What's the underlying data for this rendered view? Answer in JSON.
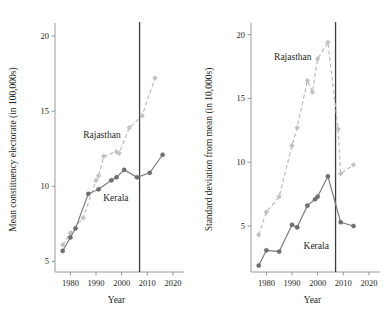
{
  "figure": {
    "background": "#ffffff",
    "width": 392,
    "height": 322,
    "panel_count": 2
  },
  "colors": {
    "kerala_line": "#7a7a7a",
    "kerala_marker": "#6e6e6e",
    "rajasthan_line": "#b9b9b9",
    "rajasthan_marker": "#c2c2c2",
    "axis": "#808080",
    "event_line": "#3d3d3d",
    "text": "#231f20"
  },
  "chart_data": [
    {
      "panel": "left",
      "type": "line",
      "title": "",
      "xlabel": "Year",
      "ylabel": "Mean constituency electorate (in 100,000s)",
      "xlim": [
        1974,
        2022
      ],
      "ylim": [
        4.3,
        20.6
      ],
      "xticks": [
        1980,
        1990,
        2000,
        2010,
        2020
      ],
      "xticklabels": [
        "1980",
        "1990",
        "2000",
        "2010",
        "2020"
      ],
      "yticks": [
        5,
        10,
        15,
        20
      ],
      "yticklabels": [
        "5",
        "10",
        "15",
        "20"
      ],
      "grid": false,
      "legend_position": "inline-annotation",
      "annotations": [
        {
          "text": "Rajasthan",
          "x": 1985.0,
          "y": 13.2
        },
        {
          "text": "Kerala",
          "x": 1992.8,
          "y": 9.0
        }
      ],
      "vertical_reference_line": {
        "x": 2007,
        "label": ""
      },
      "series": [
        {
          "name": "Rajasthan",
          "style": "dashed",
          "marker": "diamond",
          "x": [
            1977,
            1980,
            1985,
            1990,
            1991,
            1993,
            1998,
            1999,
            2003,
            2008,
            2013
          ],
          "values": [
            6.1,
            6.9,
            7.9,
            10.4,
            10.7,
            12.0,
            12.3,
            12.2,
            13.9,
            14.7,
            17.2
          ]
        },
        {
          "name": "Kerala",
          "style": "solid",
          "marker": "circle",
          "x": [
            1977,
            1980,
            1982,
            1987,
            1991,
            1996,
            1998,
            2001,
            2006,
            2011,
            2016
          ],
          "values": [
            5.7,
            6.6,
            7.2,
            9.5,
            9.8,
            10.4,
            10.6,
            11.1,
            10.6,
            10.9,
            12.1
          ]
        }
      ]
    },
    {
      "panel": "right",
      "type": "line",
      "title": "",
      "xlabel": "Year",
      "ylabel": "Standard deviation from mean (in 10,000s)",
      "xlim": [
        1974,
        2022
      ],
      "ylim": [
        1.4,
        20.6
      ],
      "xticks": [
        1980,
        1990,
        2000,
        2010,
        2020
      ],
      "xticklabels": [
        "1980",
        "1990",
        "2000",
        "2010",
        "2020"
      ],
      "yticks": [
        5,
        10,
        15,
        20
      ],
      "yticklabels": [
        "5",
        "10",
        "15",
        "20"
      ],
      "grid": false,
      "legend_position": "inline-annotation",
      "annotations": [
        {
          "text": "Rajasthan",
          "x": 1983.0,
          "y": 18.0
        },
        {
          "text": "Kerala",
          "x": 1994.5,
          "y": 3.2
        }
      ],
      "vertical_reference_line": {
        "x": 2007,
        "label": ""
      },
      "series": [
        {
          "name": "Rajasthan",
          "style": "dashed",
          "marker": "diamond",
          "x": [
            1977,
            1980,
            1985,
            1990,
            1992,
            1996,
            1998,
            2000,
            2004,
            2008,
            2009,
            2014
          ],
          "values": [
            4.3,
            6.1,
            7.3,
            11.3,
            12.7,
            16.4,
            15.5,
            18.1,
            19.4,
            12.6,
            9.1,
            9.8
          ]
        },
        {
          "name": "Kerala",
          "style": "solid",
          "marker": "circle",
          "x": [
            1977,
            1980,
            1985,
            1990,
            1992,
            1996,
            1999,
            2000,
            2004,
            2009,
            2014
          ],
          "values": [
            1.9,
            3.1,
            3.0,
            5.1,
            4.9,
            6.6,
            7.1,
            7.3,
            8.9,
            5.3,
            5.0
          ]
        }
      ]
    }
  ]
}
